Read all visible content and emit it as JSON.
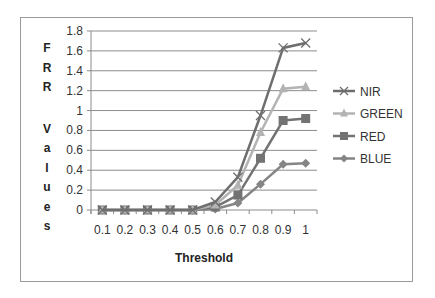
{
  "chart_data": {
    "type": "line",
    "title": "",
    "xlabel": "Threshold",
    "ylabel": "FRR Values",
    "x": [
      "0.1",
      "0.2",
      "0.3",
      "0.4",
      "0.5",
      "0.6",
      "0.7",
      "0.8",
      "0.9",
      "1"
    ],
    "ylim": [
      0,
      1.8
    ],
    "yticks": [
      "0",
      "0.2",
      "0.4",
      "0.6",
      "0.8",
      "1",
      "1.2",
      "1.4",
      "1.6",
      "1.8"
    ],
    "grid": true,
    "legend_position": "right",
    "series": [
      {
        "name": "NIR",
        "marker": "x",
        "color": "#6e6e6e",
        "values": [
          0,
          0,
          0,
          0,
          0,
          0.08,
          0.33,
          0.95,
          1.63,
          1.68
        ]
      },
      {
        "name": "GREEN",
        "marker": "triangle",
        "color": "#b3b3b3",
        "values": [
          0,
          0,
          0,
          0,
          0,
          0.05,
          0.25,
          0.78,
          1.22,
          1.24
        ]
      },
      {
        "name": "RED",
        "marker": "square",
        "color": "#737373",
        "values": [
          0,
          0,
          0,
          0,
          0,
          0.03,
          0.15,
          0.52,
          0.9,
          0.92
        ]
      },
      {
        "name": "BLUE",
        "marker": "diamond",
        "color": "#858585",
        "values": [
          0,
          0,
          0,
          0,
          0,
          0.01,
          0.07,
          0.26,
          0.46,
          0.47
        ]
      }
    ]
  }
}
